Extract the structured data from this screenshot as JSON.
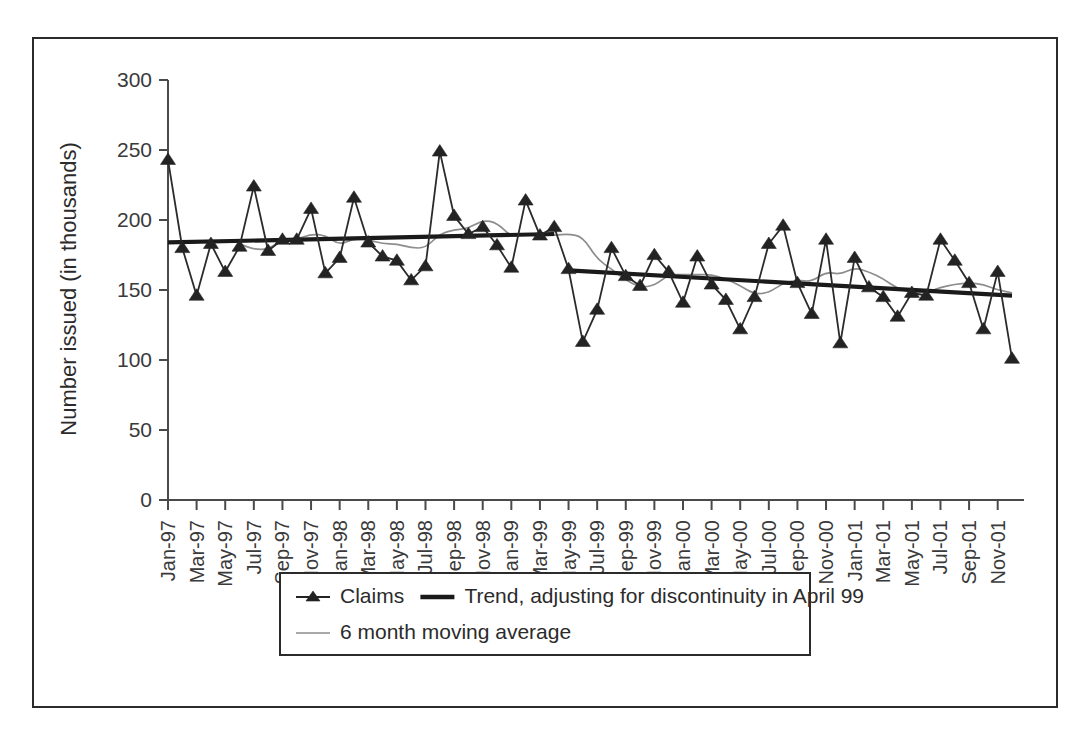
{
  "figure": {
    "background_color": "#ffffff",
    "frame_color": "#2b2b2b"
  },
  "chart_data": {
    "type": "line",
    "title": "",
    "xlabel": "",
    "ylabel": "Number issued (in thousands)",
    "ylim": [
      0,
      300
    ],
    "y_ticks": [
      0,
      50,
      100,
      150,
      200,
      250,
      300
    ],
    "y_tick_labels": [
      "0",
      "50",
      "100",
      "150",
      "200",
      "250",
      "300"
    ],
    "grid": false,
    "legend_position": "bottom",
    "x_tick_labels": [
      "Jan-97",
      "Mar-97",
      "May-97",
      "Jul-97",
      "Sep-97",
      "Nov-97",
      "Jan-98",
      "Mar-98",
      "May-98",
      "Jul-98",
      "Sep-98",
      "Nov-98",
      "Jan-99",
      "Mar-99",
      "May-99",
      "Jul-99",
      "Sep-99",
      "Nov-99",
      "Jan-00",
      "Mar-00",
      "May-00",
      "Jul-00",
      "Sep-00",
      "Nov-00",
      "Jan-01",
      "Mar-01",
      "May-01",
      "Jul-01",
      "Sep-01",
      "Nov-01"
    ],
    "x": [
      "Jan-97",
      "Feb-97",
      "Mar-97",
      "Apr-97",
      "May-97",
      "Jun-97",
      "Jul-97",
      "Aug-97",
      "Sep-97",
      "Oct-97",
      "Nov-97",
      "Dec-97",
      "Jan-98",
      "Feb-98",
      "Mar-98",
      "Apr-98",
      "May-98",
      "Jun-98",
      "Jul-98",
      "Aug-98",
      "Sep-98",
      "Oct-98",
      "Nov-98",
      "Dec-98",
      "Jan-99",
      "Feb-99",
      "Mar-99",
      "Apr-99",
      "May-99",
      "Jun-99",
      "Jul-99",
      "Aug-99",
      "Sep-99",
      "Oct-99",
      "Nov-99",
      "Dec-99",
      "Jan-00",
      "Feb-00",
      "Mar-00",
      "Apr-00",
      "May-00",
      "Jun-00",
      "Jul-00",
      "Aug-00",
      "Sep-00",
      "Oct-00",
      "Nov-00",
      "Dec-00",
      "Jan-01",
      "Feb-01",
      "Mar-01",
      "Apr-01",
      "May-01",
      "Jun-01",
      "Jul-01",
      "Aug-01",
      "Sep-01",
      "Oct-01",
      "Nov-01",
      "Dec-01"
    ],
    "series": [
      {
        "name": "Claims",
        "style": "line-with-triangle-markers",
        "color": "#232323",
        "values": [
          243,
          180,
          146,
          183,
          163,
          181,
          224,
          178,
          186,
          186,
          208,
          162,
          173,
          216,
          184,
          174,
          171,
          157,
          167,
          249,
          203,
          190,
          195,
          182,
          166,
          214,
          189,
          195,
          165,
          113,
          136,
          180,
          160,
          153,
          175,
          163,
          141,
          174,
          154,
          143,
          122,
          145,
          183,
          196,
          155,
          133,
          186,
          112,
          173,
          152,
          145,
          131,
          148,
          146,
          186,
          171,
          155,
          122,
          163,
          101
        ]
      },
      {
        "name": "Trend, adjusting for discontinuity in April 99",
        "style": "thick-line-with-break",
        "color": "#1a1a1a",
        "segments": [
          {
            "from": "Jan-97",
            "to": "Apr-99",
            "start_value": 184,
            "end_value": 190
          },
          {
            "from": "May-99",
            "to": "Dec-01",
            "start_value": 164,
            "end_value": 146
          }
        ]
      },
      {
        "name": "6 month moving average",
        "style": "thin-grey-line",
        "color": "#8d8d8d",
        "values": [
          null,
          null,
          null,
          null,
          null,
          183,
          179,
          179,
          186,
          186,
          190,
          189,
          182,
          187,
          186,
          183,
          183,
          180,
          180,
          190,
          193,
          194,
          200,
          198,
          188,
          190,
          189,
          189,
          190,
          188,
          172,
          165,
          157,
          152,
          153,
          161,
          161,
          161,
          161,
          158,
          153,
          147,
          148,
          155,
          157,
          156,
          163,
          161,
          166,
          163,
          158,
          151,
          148,
          148,
          152,
          154,
          155,
          154,
          150,
          148
        ]
      }
    ],
    "annotations": [
      {
        "text": "discontinuity in trend line",
        "at": "April 99"
      }
    ]
  },
  "legend": {
    "entries": [
      {
        "label": "Claims",
        "marker": "triangle-with-line",
        "color": "#232323"
      },
      {
        "label": "Trend, adjusting for discontinuity in April 99",
        "marker": "thick-line",
        "color": "#1a1a1a"
      },
      {
        "label": "6 month moving average",
        "marker": "thin-line",
        "color": "#8d8d8d"
      }
    ]
  }
}
